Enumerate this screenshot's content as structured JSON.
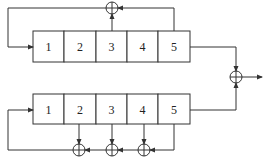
{
  "diagram": {
    "type": "lfsr-block-diagram",
    "top_register": {
      "cells": [
        "1",
        "2",
        "3",
        "4",
        "5"
      ],
      "feedback_taps": [
        "3",
        "5"
      ],
      "xor_count": 1
    },
    "bottom_register": {
      "cells": [
        "1",
        "2",
        "3",
        "4",
        "5"
      ],
      "feedback_taps": [
        "2",
        "3",
        "4",
        "5"
      ],
      "xor_count": 3
    },
    "output_combiner": {
      "inputs": [
        "top_register.5",
        "bottom_register.5"
      ],
      "symbol": "xor"
    },
    "colors": {
      "line": "#333333",
      "background": "#ffffff"
    }
  }
}
